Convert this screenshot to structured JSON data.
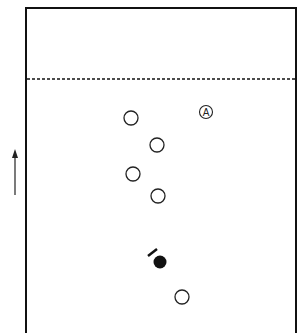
{
  "diagram": {
    "field": {
      "left": 26,
      "top": 8,
      "right": 296,
      "bottom": 333,
      "stroke": "#111111"
    },
    "dashed_line": {
      "y": 79
    },
    "direction_arrow": {
      "x": 15,
      "y1": 195,
      "y2": 150,
      "label": "direction of play"
    },
    "open_circles": [
      {
        "x": 131,
        "y": 118
      },
      {
        "x": 157,
        "y": 145
      },
      {
        "x": 133,
        "y": 174
      },
      {
        "x": 158,
        "y": 196
      },
      {
        "x": 182,
        "y": 297
      }
    ],
    "labeled_player": {
      "x": 206,
      "y": 112,
      "label": "A"
    },
    "filled_player": {
      "x": 160,
      "y": 262
    },
    "stick_mark": {
      "x1": 148,
      "y1": 256,
      "x2": 157,
      "y2": 249
    }
  }
}
